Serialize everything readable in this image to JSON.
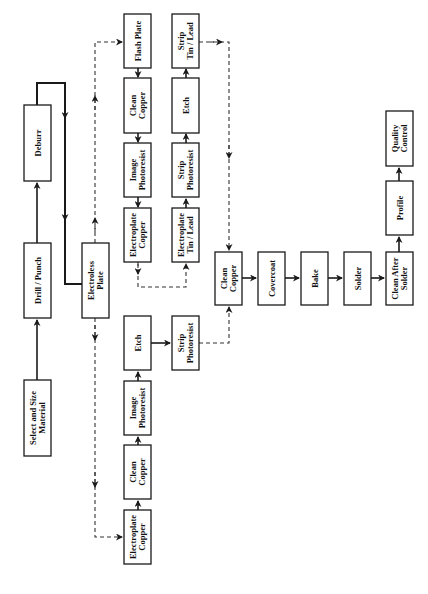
{
  "diagram": {
    "orientation": "rotated-90-ccw",
    "nodes": [
      {
        "id": "select",
        "lines": [
          "Select and Size",
          "Material"
        ],
        "x": 24,
        "y": 380,
        "w": 27,
        "h": 76
      },
      {
        "id": "drill",
        "lines": [
          "Drill / Punch"
        ],
        "x": 24,
        "y": 243,
        "w": 27,
        "h": 75
      },
      {
        "id": "deburr",
        "lines": [
          "Deburr"
        ],
        "x": 24,
        "y": 105,
        "w": 27,
        "h": 76
      },
      {
        "id": "electroless",
        "lines": [
          "Electroless",
          "Plate"
        ],
        "x": 82,
        "y": 243,
        "w": 27,
        "h": 75
      },
      {
        "id": "flash",
        "lines": [
          "Flash Plate"
        ],
        "x": 124,
        "y": 14,
        "w": 27,
        "h": 54
      },
      {
        "id": "clean1",
        "lines": [
          "Clean",
          "Copper"
        ],
        "x": 124,
        "y": 78,
        "w": 27,
        "h": 55
      },
      {
        "id": "image1",
        "lines": [
          "Image",
          "Photoresist"
        ],
        "x": 124,
        "y": 143,
        "w": 27,
        "h": 54
      },
      {
        "id": "eplcu1",
        "lines": [
          "Electroplate",
          "Copper"
        ],
        "x": 124,
        "y": 208,
        "w": 27,
        "h": 54
      },
      {
        "id": "striptl",
        "lines": [
          "Strip",
          "Tin / Lead"
        ],
        "x": 172,
        "y": 14,
        "w": 27,
        "h": 54
      },
      {
        "id": "etch1",
        "lines": [
          "Etch"
        ],
        "x": 172,
        "y": 78,
        "w": 27,
        "h": 55
      },
      {
        "id": "strippr1",
        "lines": [
          "Strip",
          "Photoresist"
        ],
        "x": 172,
        "y": 143,
        "w": 27,
        "h": 54
      },
      {
        "id": "epltl",
        "lines": [
          "Electroplate",
          "Tin / Lead"
        ],
        "x": 172,
        "y": 208,
        "w": 27,
        "h": 54
      },
      {
        "id": "etch2",
        "lines": [
          "Etch"
        ],
        "x": 124,
        "y": 316,
        "w": 27,
        "h": 54
      },
      {
        "id": "strippr2",
        "lines": [
          "Strip",
          "Photoresist"
        ],
        "x": 172,
        "y": 316,
        "w": 27,
        "h": 54
      },
      {
        "id": "image2",
        "lines": [
          "Image",
          "Photoresist"
        ],
        "x": 124,
        "y": 381,
        "w": 27,
        "h": 54
      },
      {
        "id": "clean2",
        "lines": [
          "Clean",
          "Copper"
        ],
        "x": 124,
        "y": 445,
        "w": 27,
        "h": 54
      },
      {
        "id": "eplcu2",
        "lines": [
          "Electroplate",
          "Copper"
        ],
        "x": 124,
        "y": 510,
        "w": 27,
        "h": 54
      },
      {
        "id": "clean3",
        "lines": [
          "Clean",
          "Copper"
        ],
        "x": 215,
        "y": 252,
        "w": 27,
        "h": 53
      },
      {
        "id": "covercoat",
        "lines": [
          "Covercoat"
        ],
        "x": 258,
        "y": 252,
        "w": 27,
        "h": 53
      },
      {
        "id": "bake",
        "lines": [
          "Bake"
        ],
        "x": 301,
        "y": 252,
        "w": 27,
        "h": 53
      },
      {
        "id": "solder",
        "lines": [
          "Solder"
        ],
        "x": 344,
        "y": 252,
        "w": 27,
        "h": 53
      },
      {
        "id": "cas",
        "lines": [
          "Clean After",
          "Solder"
        ],
        "x": 386,
        "y": 252,
        "w": 27,
        "h": 53
      },
      {
        "id": "profile",
        "lines": [
          "Profile"
        ],
        "x": 386,
        "y": 181,
        "w": 27,
        "h": 54
      },
      {
        "id": "qc",
        "lines": [
          "Quality",
          "Control"
        ],
        "x": 386,
        "y": 111,
        "w": 27,
        "h": 55
      }
    ]
  }
}
